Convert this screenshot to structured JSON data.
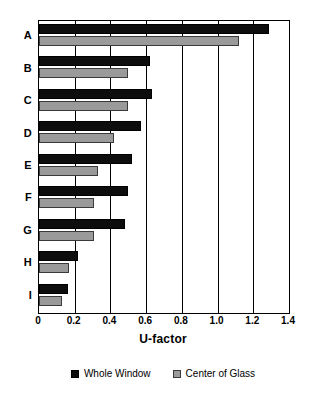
{
  "top_clipped_text": "",
  "chart_data": {
    "type": "bar",
    "orientation": "horizontal",
    "title": "",
    "xlabel": "U-factor",
    "ylabel": "",
    "xlim": [
      0,
      1.4
    ],
    "xticks": [
      "0",
      "0.2",
      "0.4",
      "0.6",
      "0.8",
      "1.0",
      "1.2",
      "1.4"
    ],
    "xtick_values": [
      0,
      0.2,
      0.4,
      0.6,
      0.8,
      1.0,
      1.2,
      1.4
    ],
    "grid": true,
    "legend_position": "bottom-center",
    "categories": [
      "A",
      "B",
      "C",
      "D",
      "E",
      "F",
      "G",
      "H",
      "I"
    ],
    "series": [
      {
        "name": "Whole Window",
        "color": "#0d0d0d",
        "values": [
          1.29,
          0.62,
          0.63,
          0.57,
          0.52,
          0.5,
          0.48,
          0.22,
          0.16
        ]
      },
      {
        "name": "Center of Glass",
        "color": "#9a9a9a",
        "values": [
          1.12,
          0.5,
          0.5,
          0.42,
          0.33,
          0.31,
          0.31,
          0.17,
          0.13
        ]
      }
    ]
  }
}
